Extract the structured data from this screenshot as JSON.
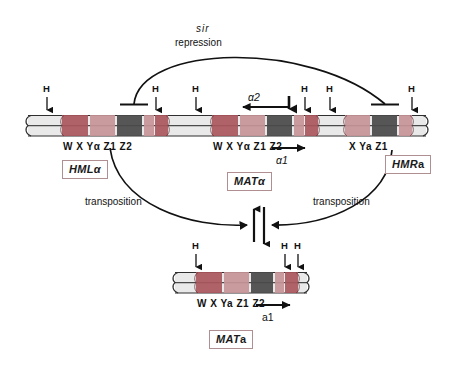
{
  "figure": {
    "title_process_top": "repression",
    "sir_italic": "sir",
    "transposition_left": "transposition",
    "transposition_right": "transposition"
  },
  "loci": [
    {
      "id": "HML",
      "box_label_italic": "HML",
      "box_label_upright": "α",
      "segments": [
        {
          "name": "W",
          "label": "W",
          "color": "#a9565c"
        },
        {
          "name": "X",
          "label": "X",
          "color": "#c59297"
        },
        {
          "name": "Ya",
          "label": "Yα",
          "color": "#4a4a4a"
        },
        {
          "name": "Z1",
          "label": "Z1",
          "color": "#c59297"
        },
        {
          "name": "Z2",
          "label": "Z2",
          "color": "#a9565c"
        }
      ],
      "label_text": "W   X   Yα Z1 Z2"
    },
    {
      "id": "MATalpha",
      "box_label_italic": "MAT",
      "box_label_upright": "α",
      "segments": [
        {
          "name": "W",
          "label": "W",
          "color": "#a9565c"
        },
        {
          "name": "X",
          "label": "X",
          "color": "#c59297"
        },
        {
          "name": "Ya",
          "label": "Yα",
          "color": "#4a4a4a"
        },
        {
          "name": "Z1",
          "label": "Z1",
          "color": "#c59297"
        },
        {
          "name": "Z2",
          "label": "Z2",
          "color": "#a9565c"
        }
      ],
      "label_text": "W   X   Yα Z1 Z2",
      "transcripts": [
        {
          "name": "alpha2",
          "label": "α2",
          "direction": "left"
        },
        {
          "name": "alpha1",
          "label": "α1",
          "direction": "right"
        }
      ]
    },
    {
      "id": "HMR",
      "box_label_italic": "HMR",
      "box_label_upright": "a",
      "segments": [
        {
          "name": "X",
          "label": "X",
          "color": "#c59297"
        },
        {
          "name": "Ya",
          "label": "Ya",
          "color": "#4a4a4a"
        },
        {
          "name": "Z1",
          "label": "Z1",
          "color": "#c59297"
        }
      ],
      "label_text": "X   Ya  Z1"
    },
    {
      "id": "MATa",
      "box_label_italic": "MAT",
      "box_label_upright": "a",
      "segments": [
        {
          "name": "W",
          "label": "W",
          "color": "#a9565c"
        },
        {
          "name": "X",
          "label": "X",
          "color": "#c59297"
        },
        {
          "name": "Ya",
          "label": "Ya",
          "color": "#4a4a4a"
        },
        {
          "name": "Z1",
          "label": "Z1",
          "color": "#c59297"
        },
        {
          "name": "Z2",
          "label": "Z2",
          "color": "#a9565c"
        }
      ],
      "label_text": "W   X   Ya Z1 Z2",
      "transcripts": [
        {
          "name": "a1",
          "label": "a1",
          "direction": "right"
        }
      ]
    }
  ],
  "h_markers": {
    "label": "H",
    "count_top_chromosome": 6,
    "count_bottom_chromosome": 3
  },
  "colors": {
    "chromosome_fill": "#e9e9e9",
    "chromosome_edge": "#2a2a2a",
    "segment_dark_red": "#a9565c",
    "segment_pink": "#c59297",
    "segment_gray": "#4a4a4a",
    "box_border": "#b08f93",
    "ink": "#111111"
  }
}
